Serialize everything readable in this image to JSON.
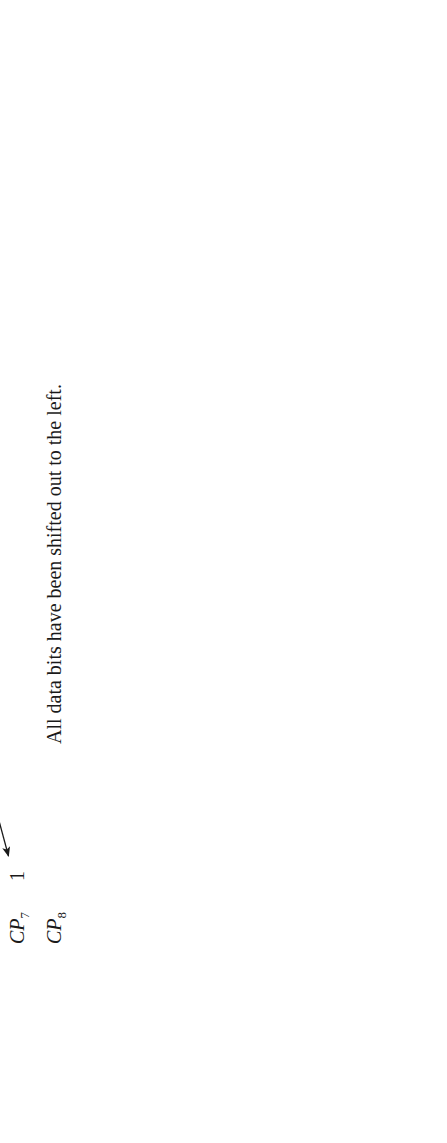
{
  "figure": {
    "header_title": "State of register",
    "note": "All data bits have been shifted out to the left.",
    "columns": [
      {
        "base": "Q",
        "sub": "1"
      },
      {
        "base": "Q",
        "sub": "2"
      },
      {
        "base": "Q",
        "sub": "3"
      },
      {
        "base": "Q",
        "sub": "4"
      },
      {
        "base": "Q",
        "sub": "5"
      },
      {
        "base": "Q",
        "sub": "6"
      },
      {
        "base": "Q",
        "sub": "7"
      },
      {
        "base": "Q",
        "sub": "8"
      }
    ],
    "rows": [
      {
        "label_text": "Original data in register",
        "label_prefix": "Original data in register",
        "label_italic": "",
        "label_sub": ""
      },
      {
        "label_text": "After CP1",
        "label_prefix": "After ",
        "label_italic": "CP",
        "label_sub": "1"
      },
      {
        "label_text": "CP2",
        "label_prefix": "",
        "label_italic": "CP",
        "label_sub": "2"
      },
      {
        "label_text": "CP3",
        "label_prefix": "",
        "label_italic": "CP",
        "label_sub": "3"
      },
      {
        "label_text": "CP4",
        "label_prefix": "",
        "label_italic": "CP",
        "label_sub": "4"
      },
      {
        "label_text": "CP5",
        "label_prefix": "",
        "label_italic": "CP",
        "label_sub": "5"
      },
      {
        "label_text": "CP6",
        "label_prefix": "",
        "label_italic": "CP",
        "label_sub": "6"
      },
      {
        "label_text": "CP7",
        "label_prefix": "",
        "label_italic": "CP",
        "label_sub": "7"
      },
      {
        "label_text": "CP8",
        "label_prefix": "",
        "label_italic": "CP",
        "label_sub": "8"
      }
    ],
    "grid": [
      [
        "1",
        "1",
        "0",
        "1",
        "0",
        "1",
        "0",
        "1"
      ],
      [
        "1",
        "0",
        "1",
        "0",
        "1",
        "0",
        "1",
        ""
      ],
      [
        "0",
        "1",
        "0",
        "1",
        "0",
        "1",
        "",
        ""
      ],
      [
        "1",
        "0",
        "1",
        "0",
        "1",
        "",
        "",
        ""
      ],
      [
        "0",
        "1",
        "0",
        "1",
        "",
        "",
        "",
        ""
      ],
      [
        "1",
        "0",
        "1",
        "",
        "",
        "",
        "",
        ""
      ],
      [
        "0",
        "1",
        "",
        "",
        "",
        "",
        "",
        ""
      ],
      [
        "1",
        "",
        "",
        "",
        "",
        "",
        "",
        ""
      ],
      [
        "",
        "",
        "",
        "",
        "",
        "",
        "",
        ""
      ]
    ],
    "chart_data": {
      "type": "table",
      "title": "State of register",
      "columns": [
        "Q1",
        "Q2",
        "Q3",
        "Q4",
        "Q5",
        "Q6",
        "Q7",
        "Q8"
      ],
      "row_labels": [
        "Original data in register",
        "After CP1",
        "CP2",
        "CP3",
        "CP4",
        "CP5",
        "CP6",
        "CP7",
        "CP8"
      ],
      "values": [
        [
          "1",
          "1",
          "0",
          "1",
          "0",
          "1",
          "0",
          "1"
        ],
        [
          "1",
          "0",
          "1",
          "0",
          "1",
          "0",
          "1",
          ""
        ],
        [
          "0",
          "1",
          "0",
          "1",
          "0",
          "1",
          "",
          ""
        ],
        [
          "1",
          "0",
          "1",
          "0",
          "1",
          "",
          "",
          ""
        ],
        [
          "0",
          "1",
          "0",
          "1",
          "",
          "",
          "",
          ""
        ],
        [
          "1",
          "0",
          "1",
          "",
          "",
          "",
          "",
          ""
        ],
        [
          "0",
          "1",
          "",
          "",
          "",
          "",
          "",
          ""
        ],
        [
          "1",
          "",
          "",
          "",
          "",
          "",
          "",
          ""
        ],
        [
          "",
          "",
          "",
          "",
          "",
          "",
          "",
          ""
        ]
      ],
      "annotations": [
        "All data bits have been shifted out to the left."
      ],
      "arrow_meaning": "each bit shifts one position left on every clock pulse"
    }
  }
}
